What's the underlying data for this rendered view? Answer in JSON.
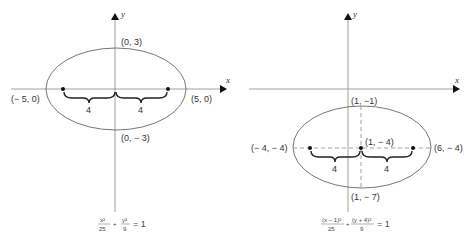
{
  "left_diagram": {
    "x_axis_label": "x",
    "y_axis_label": "y",
    "points": {
      "top": "(0, 3)",
      "bottom": "(0, − 3)",
      "left": "(− 5, 0)",
      "right": "(5, 0)"
    },
    "focal_distance_left": "4",
    "focal_distance_right": "4",
    "equation": {
      "term1_num": "x²",
      "term1_den": "25",
      "plus": "+",
      "term2_num": "y²",
      "term2_den": "9",
      "equals": "= 1"
    }
  },
  "right_diagram": {
    "x_axis_label": "x",
    "y_axis_label": "y",
    "points": {
      "top": "(1, −1)",
      "center": "(1, − 4)",
      "bottom": "(1, − 7)",
      "left": "(− 4, − 4)",
      "right": "(6, − 4)"
    },
    "focal_distance_left": "4",
    "focal_distance_right": "4",
    "equation": {
      "term1_num": "(x − 1)²",
      "term1_den": "25",
      "plus": "+",
      "term2_num": "(y + 4)²",
      "term2_den": "9",
      "equals": "= 1"
    }
  },
  "colors": {
    "line": "#555555",
    "axis": "#777777",
    "dot": "#111111",
    "brace": "#222222"
  }
}
